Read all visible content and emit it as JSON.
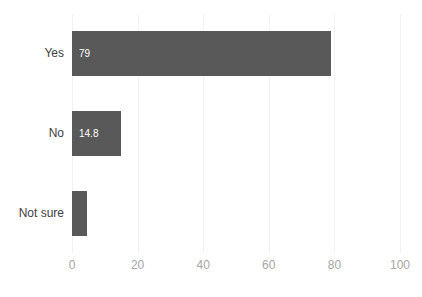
{
  "chart_data": {
    "type": "bar",
    "orientation": "horizontal",
    "title": "",
    "xlabel": "",
    "ylabel": "",
    "categories": [
      "Yes",
      "No",
      "Not sure"
    ],
    "values": [
      79,
      14.8,
      4.5
    ],
    "data_labels": [
      "79",
      "14.8",
      ""
    ],
    "xlim": [
      0,
      100
    ],
    "xticks": [
      0,
      20,
      40,
      60,
      80,
      100
    ],
    "xtick_labels": [
      "0",
      "20",
      "40",
      "60",
      "80",
      "100"
    ],
    "grid": true,
    "grid_axis": "x",
    "legend": false,
    "series": [
      {
        "name": "",
        "values": [
          79,
          14.8,
          4.5
        ]
      }
    ]
  },
  "style": {
    "bar_color": "#595959",
    "grid_color": "#f2f2f2",
    "tick_label_color": "#a6a6a6",
    "category_label_color": "#404040",
    "data_label_color": "#ffffff",
    "background": "#ffffff"
  }
}
